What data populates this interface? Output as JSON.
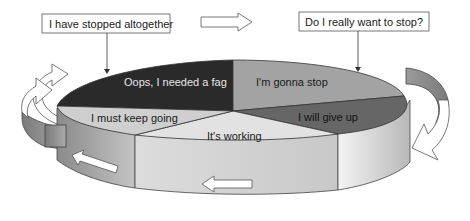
{
  "diagram": {
    "title_boxes": {
      "left": "I have stopped altogether",
      "right": "Do I really want to stop?"
    },
    "slices": [
      {
        "id": "oops",
        "label": "Oops, I needed a fag",
        "color": "#2a2a2a",
        "text_color": "#e6e6e6"
      },
      {
        "id": "gonna",
        "label": "I'm gonna stop",
        "color": "#a3a3a3",
        "text_color": "#1a1a1a"
      },
      {
        "id": "giveup",
        "label": "I will give up",
        "color": "#666666",
        "text_color": "#111111"
      },
      {
        "id": "working",
        "label": "It's working",
        "color": "#e2e2e2",
        "text_color": "#1a1a1a"
      },
      {
        "id": "keepgoing",
        "label": "I must keep going",
        "color": "#cfcfcf",
        "text_color": "#1a1a1a"
      }
    ],
    "arrows": [
      {
        "id": "top-right-arrow",
        "direction": "right"
      },
      {
        "id": "right-curved-arrow",
        "direction": "down-left"
      },
      {
        "id": "bottom-left-arrow",
        "direction": "left"
      },
      {
        "id": "left-side-arrow",
        "direction": "up-left"
      },
      {
        "id": "left-curved-arrow",
        "direction": "up-right"
      }
    ]
  }
}
